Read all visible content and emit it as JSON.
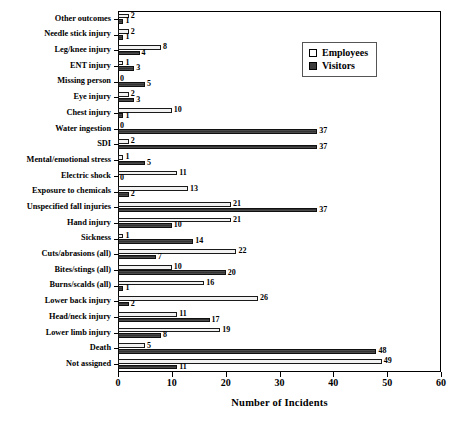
{
  "chart_data": {
    "type": "bar",
    "orientation": "horizontal",
    "title": "",
    "xlabel": "Number of Incidents",
    "ylabel": "",
    "xlim": [
      0,
      60
    ],
    "xticks": [
      0,
      10,
      20,
      30,
      40,
      50,
      60
    ],
    "grid": false,
    "legend_position": "top-right",
    "categories": [
      "Other outcomes",
      "Needle stick injury",
      "Leg/knee injury",
      "ENT injury",
      "Missing person",
      "Eye injury",
      "Chest injury",
      "Water ingestion",
      "SDI",
      "Mental/emotional stress",
      "Electric shock",
      "Exposure to chemicals",
      "Unspecified fall injuries",
      "Hand injury",
      "Sickness",
      "Cuts/abrasions (all)",
      "Bites/stings (all)",
      "Burns/scalds (all)",
      "Lower back injury",
      "Head/neck injury",
      "Lower limb injury",
      "Death",
      "Not assigned"
    ],
    "series": [
      {
        "name": "Employees",
        "color": "#f2f2f2",
        "values": [
          2,
          2,
          8,
          1,
          0,
          2,
          10,
          0,
          2,
          1,
          11,
          13,
          21,
          21,
          1,
          22,
          10,
          16,
          26,
          11,
          19,
          5,
          49
        ]
      },
      {
        "name": "Visitors",
        "color": "#3b3b3b",
        "values": [
          1,
          1,
          4,
          3,
          5,
          3,
          1,
          37,
          37,
          5,
          0,
          2,
          37,
          10,
          14,
          7,
          20,
          1,
          2,
          17,
          8,
          48,
          11
        ]
      }
    ]
  },
  "legend": {
    "entries": [
      {
        "label": "Employees",
        "swatch": "open-square-icon"
      },
      {
        "label": "Visitors",
        "swatch": "filled-square-icon"
      }
    ]
  }
}
